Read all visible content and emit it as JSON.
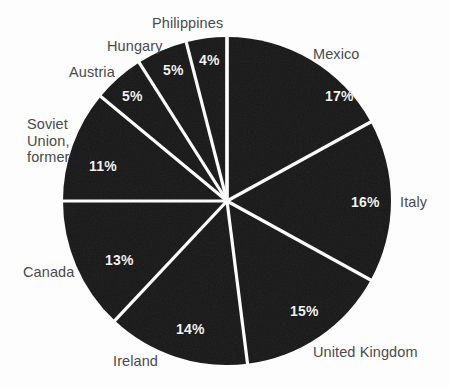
{
  "chart_data": {
    "type": "pie",
    "title": "",
    "subtitle": "",
    "xlabel": "",
    "ylabel": "",
    "legend_position": "none",
    "grid": false,
    "units": "percent",
    "start_angle_deg": 0,
    "direction": "clockwise",
    "categories": [
      "Mexico",
      "Italy",
      "United Kingdom",
      "Ireland",
      "Canada",
      "Soviet Union, former",
      "Austria",
      "Hungary",
      "Philippines"
    ],
    "values": [
      17,
      16,
      15,
      14,
      13,
      11,
      5,
      5,
      4
    ],
    "slices": [
      {
        "name": "Mexico",
        "value": 17,
        "value_label": "17%",
        "label": "Mexico",
        "label_lines": [
          "Mexico"
        ],
        "label_x": 313,
        "label_y": 46,
        "pct_x": 325,
        "pct_y": 88
      },
      {
        "name": "Italy",
        "value": 16,
        "value_label": "16%",
        "label": "Italy",
        "label_lines": [
          "Italy"
        ],
        "label_x": 400,
        "label_y": 194,
        "pct_x": 351,
        "pct_y": 194
      },
      {
        "name": "United Kingdom",
        "value": 15,
        "value_label": "15%",
        "label": "United Kingdom",
        "label_lines": [
          "United Kingdom"
        ],
        "label_x": 313,
        "label_y": 344,
        "pct_x": 290,
        "pct_y": 303
      },
      {
        "name": "Ireland",
        "value": 14,
        "value_label": "14%",
        "label": "Ireland",
        "label_lines": [
          "Ireland"
        ],
        "label_x": 113,
        "label_y": 353,
        "pct_x": 176,
        "pct_y": 321
      },
      {
        "name": "Canada",
        "value": 13,
        "value_label": "13%",
        "label": "Canada",
        "label_lines": [
          "Canada"
        ],
        "label_x": 23,
        "label_y": 264,
        "pct_x": 105,
        "pct_y": 252
      },
      {
        "name": "Soviet Union, former",
        "value": 11,
        "value_label": "11%",
        "label": "Soviet Union, former",
        "label_lines": [
          "Soviet",
          "Union,",
          "former"
        ],
        "label_x": 27,
        "label_y": 116,
        "pct_x": 89,
        "pct_y": 158
      },
      {
        "name": "Austria",
        "value": 5,
        "value_label": "5%",
        "label": "Austria",
        "label_lines": [
          "Austria"
        ],
        "label_x": 69,
        "label_y": 64,
        "pct_x": 122,
        "pct_y": 88
      },
      {
        "name": "Hungary",
        "value": 5,
        "value_label": "5%",
        "label": "Hungary",
        "label_lines": [
          "Hungary"
        ],
        "label_x": 107,
        "label_y": 38,
        "pct_x": 163,
        "pct_y": 62
      },
      {
        "name": "Philippines",
        "value": 4,
        "value_label": "4%",
        "label": "Philippines",
        "label_lines": [
          "Philippines"
        ],
        "label_x": 152,
        "label_y": 15,
        "pct_x": 199,
        "pct_y": 52
      }
    ]
  },
  "style": {
    "background_color": "#fdfdfd",
    "slice_fill": "#171717",
    "slice_separator_color": "#ffffff",
    "percent_text_color": "#f2f2f2",
    "category_text_color": "#4a4a4a"
  },
  "geometry": {
    "center_x": 227,
    "center_y": 201,
    "radius": 164,
    "separator_width": 3.2
  }
}
